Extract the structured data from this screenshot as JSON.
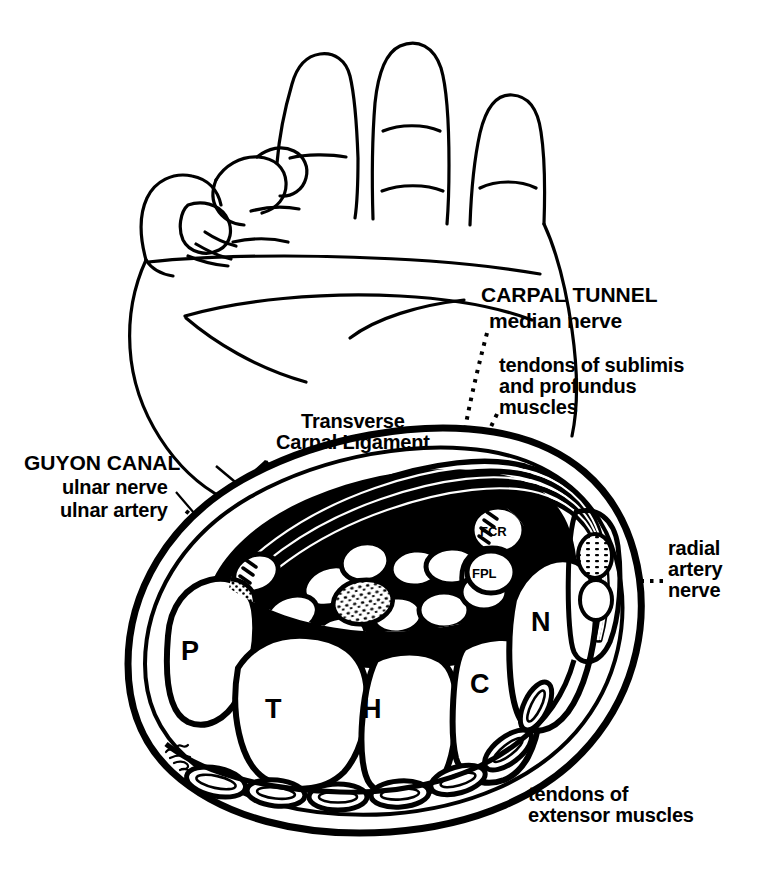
{
  "figure": {
    "signature": "95",
    "ink_color": "#000000",
    "background_color": "#ffffff"
  },
  "labels": {
    "carpal_tunnel": "CARPAL TUNNEL",
    "median_nerve": "median nerve",
    "tendons_sublimis_profundus": "tendons of sublimis\nand profundus\nmuscles",
    "transverse_carpal_ligament": "Transverse\nCarpal Ligament",
    "guyon_canal": "GUYON CANAL",
    "ulnar_nerve": "ulnar nerve",
    "ulnar_artery": "ulnar artery",
    "radial_artery_nerve": "radial\nartery\nnerve",
    "tendons_extensor": "tendons of\nextensor muscles"
  },
  "tendon_abbreviations": {
    "fcr": "FCR",
    "fpl": "FPL"
  },
  "bones": {
    "pisiform": "P",
    "triquetrum": "T",
    "hamate": "H",
    "capitate": "C",
    "navicular": "N"
  },
  "hand_drawing": {
    "name": "line drawing of a hand, palm facing viewer with fingers flexed"
  }
}
